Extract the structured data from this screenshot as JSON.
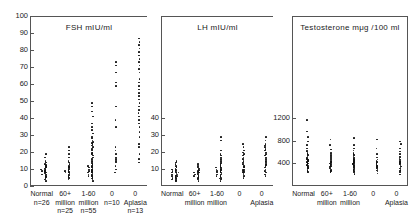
{
  "figure": {
    "panels": [
      {
        "id": "fsh",
        "title": "FSH  mIU/ml",
        "ylim": [
          0,
          100
        ],
        "yticks": [
          0,
          10,
          20,
          30,
          40,
          50,
          60,
          70,
          80,
          90,
          100
        ],
        "ytick_labels": [
          "0",
          "10",
          "20",
          "30",
          "40",
          "50",
          "60",
          "70",
          "80",
          "90",
          "100"
        ],
        "show_counts": true,
        "groups": [
          {
            "label": "Normal",
            "label2": "",
            "label3": "n=26",
            "n": 26,
            "values": [
              4,
              5,
              6,
              6.5,
              7,
              7.5,
              8,
              8,
              8.5,
              9,
              9.5,
              10,
              10,
              10.5,
              11,
              11,
              11.5,
              12,
              12.5,
              13,
              13.5,
              14,
              15,
              16,
              18,
              20
            ]
          },
          {
            "label": "60+",
            "label2": "million",
            "label3": "n=25",
            "n": 25,
            "values": [
              5,
              6,
              6.5,
              7,
              7.5,
              8,
              8.5,
              9,
              9,
              9.5,
              10,
              10,
              10.5,
              11,
              11.5,
              12,
              12.5,
              13,
              14,
              15,
              16,
              18,
              20,
              22,
              24
            ]
          },
          {
            "label": "1-60",
            "label2": "million",
            "label3": "n=55",
            "n": 55,
            "values": [
              4,
              5,
              5.5,
              6,
              6.5,
              7,
              7,
              7.5,
              8,
              8,
              8.5,
              9,
              9,
              9.5,
              10,
              10,
              10.5,
              11,
              11,
              11.5,
              12,
              12,
              12.5,
              13,
              13,
              13.5,
              14,
              14.5,
              15,
              15.5,
              16,
              17,
              18,
              19,
              20,
              20.5,
              21,
              22,
              23,
              24,
              25,
              26,
              26.5,
              27,
              28,
              29,
              30,
              32,
              34,
              36,
              38,
              42,
              45,
              48,
              50
            ]
          },
          {
            "label": "0",
            "label2": "",
            "label3": "n=10",
            "n": 10,
            "values": [
              9,
              11,
              13,
              15,
              16,
              17,
              18,
              20,
              22,
              24,
              36,
              40,
              48,
              60,
              62,
              68,
              72,
              74
            ]
          },
          {
            "label": "0",
            "label2": "Aplasia",
            "label3": "n=13",
            "n": 13,
            "values": [
              15,
              17,
              20,
              24,
              26,
              30,
              33,
              36,
              38,
              40,
              42,
              44,
              46,
              48,
              50,
              52,
              54,
              56,
              58,
              60,
              62,
              64,
              68,
              70,
              72,
              74,
              76,
              78,
              80,
              82,
              84,
              86,
              88
            ]
          }
        ]
      },
      {
        "id": "lh",
        "title": "LH  mIU/ml",
        "ylim": [
          0,
          100
        ],
        "yticks": [
          10,
          20,
          30,
          40
        ],
        "ytick_labels": [
          "10",
          "20",
          "30",
          "40"
        ],
        "show_counts": false,
        "groups": [
          {
            "label": "Normal",
            "label2": "",
            "label3": "",
            "values": [
              4,
              4.5,
              5,
              5,
              5.5,
              6,
              6,
              6.5,
              7,
              7,
              7,
              7.5,
              8,
              8,
              8,
              8.5,
              9,
              9,
              9,
              9.5,
              10,
              10,
              10.5,
              11,
              11,
              11.5,
              12,
              12.5,
              13,
              14,
              15,
              16
            ]
          },
          {
            "label": "60+",
            "label2": "million",
            "label3": "",
            "values": [
              4,
              5,
              5.5,
              6,
              6.5,
              7,
              7,
              7.5,
              8,
              8,
              8.5,
              9,
              9,
              9.5,
              10,
              10.5,
              11,
              11.5,
              12,
              13,
              14
            ]
          },
          {
            "label": "1-60",
            "label2": "million",
            "label3": "",
            "values": [
              4,
              5,
              5.5,
              6,
              6.5,
              7,
              7,
              7.5,
              8,
              8,
              8.5,
              9,
              9,
              9.5,
              10,
              10,
              10.5,
              11,
              11,
              11.5,
              12,
              12,
              12.5,
              13,
              13.5,
              14,
              14.5,
              15,
              16,
              17,
              18,
              19,
              20,
              22,
              28,
              30
            ]
          },
          {
            "label": "0",
            "label2": "",
            "label3": "",
            "values": [
              6,
              7,
              8,
              8.5,
              9,
              9.5,
              10,
              10.5,
              11,
              12,
              12.5,
              13,
              14,
              15,
              16,
              17,
              18,
              19,
              20,
              21,
              22,
              24,
              26
            ]
          },
          {
            "label": "0",
            "label2": "Aplasia",
            "label3": "",
            "values": [
              7,
              8,
              9,
              10,
              11,
              12,
              13,
              13.5,
              14,
              15,
              15.5,
              16,
              17,
              18,
              19,
              20,
              21,
              22,
              23,
              24,
              25,
              26,
              28,
              30
            ]
          }
        ]
      },
      {
        "id": "testosterone",
        "title": "Testosterone   mμg /100 ml",
        "ylim": [
          0,
          3000
        ],
        "yticks": [
          400,
          800,
          1200
        ],
        "ytick_labels": [
          "400",
          "800",
          "1200"
        ],
        "show_counts": false,
        "groups": [
          {
            "label": "Normal",
            "label2": "",
            "label3": "",
            "values": [
              280,
              300,
              320,
              340,
              350,
              360,
              380,
              390,
              400,
              410,
              420,
              430,
              440,
              450,
              460,
              470,
              480,
              490,
              500,
              510,
              520,
              540,
              560,
              580,
              600,
              620,
              650,
              700,
              760,
              820,
              900,
              1000,
              1200
            ]
          },
          {
            "label": "60+",
            "label2": "million",
            "label3": "",
            "values": [
              280,
              300,
              320,
              340,
              360,
              380,
              390,
              400,
              410,
              420,
              430,
              450,
              460,
              470,
              480,
              500,
              520,
              540,
              560,
              580,
              620,
              680,
              760,
              860
            ]
          },
          {
            "label": "1-60",
            "label2": "million",
            "label3": "",
            "values": [
              250,
              270,
              290,
              300,
              320,
              330,
              340,
              350,
              360,
              370,
              380,
              390,
              400,
              410,
              420,
              430,
              440,
              450,
              460,
              470,
              480,
              490,
              500,
              510,
              520,
              540,
              560,
              580,
              600,
              620,
              660,
              700,
              760,
              880
            ]
          },
          {
            "label": "0",
            "label2": "",
            "label3": "",
            "values": [
              260,
              290,
              310,
              330,
              350,
              370,
              390,
              400,
              420,
              440,
              460,
              480,
              500,
              540,
              600,
              700,
              860
            ]
          },
          {
            "label": "0",
            "label2": "Aplasia",
            "label3": "",
            "values": [
              240,
              270,
              300,
              320,
              340,
              360,
              380,
              400,
              420,
              440,
              460,
              480,
              500,
              520,
              540,
              560,
              600,
              640,
              700,
              780,
              820
            ]
          }
        ]
      }
    ]
  },
  "chart_data": {
    "type": "scatter",
    "title": "",
    "panels": [
      {
        "title": "FSH  mIU/ml",
        "ylabel": "FSH mIU/ml",
        "ylim": [
          0,
          100
        ],
        "yticks": [
          0,
          10,
          20,
          30,
          40,
          50,
          60,
          70,
          80,
          90,
          100
        ],
        "categories": [
          "Normal",
          "60+ million",
          "1-60 million",
          "0",
          "0 Aplasia"
        ],
        "counts": [
          26,
          25,
          55,
          10,
          13
        ],
        "grid": false
      },
      {
        "title": "LH  mIU/ml",
        "ylabel": "LH mIU/ml",
        "ylim": [
          0,
          100
        ],
        "yticks": [
          10,
          20,
          30,
          40
        ],
        "categories": [
          "Normal",
          "60+ million",
          "1-60 million",
          "0",
          "0 Aplasia"
        ],
        "counts": [
          26,
          25,
          55,
          10,
          13
        ],
        "grid": false
      },
      {
        "title": "Testosterone   mμg /100 ml",
        "ylabel": "Testosterone mμg/100 ml",
        "ylim": [
          0,
          3000
        ],
        "yticks": [
          400,
          800,
          1200
        ],
        "categories": [
          "Normal",
          "60+ million",
          "1-60 million",
          "0",
          "0 Aplasia"
        ],
        "counts": [
          26,
          25,
          55,
          10,
          13
        ],
        "grid": false
      }
    ],
    "legend": [],
    "xlabel": ""
  }
}
